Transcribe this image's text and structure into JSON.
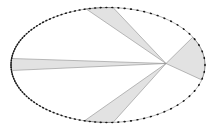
{
  "figure": {
    "name": "elliptical-orbit-equal-area-sectors",
    "canvas": {
      "width": 216,
      "height": 131,
      "background": "#ffffff"
    },
    "ellipse": {
      "cx": 108,
      "cy": 65,
      "rx": 97,
      "ry": 57.5,
      "stroke": "#6e6e6e",
      "stroke_width": 0.5
    },
    "focus": {
      "x": 166,
      "y": 63.5
    },
    "orbit_dots": {
      "count": 104,
      "eccentricity": 0.5,
      "color": "#151515",
      "radius_along": 1.25,
      "radius_across": 0.8
    },
    "wedge_style": {
      "fill": "#e2e2e2",
      "stroke": "#8f8f8f",
      "stroke_width": 0.6
    },
    "wedges": [
      {
        "name": "sector-left",
        "t_start": 173.5,
        "t_end": 185.5
      },
      {
        "name": "sector-top",
        "t_start": 87,
        "t_end": 103
      },
      {
        "name": "sector-right",
        "t_start": -15,
        "t_end": 29
      },
      {
        "name": "sector-bottom",
        "t_start": -104,
        "t_end": -87
      }
    ]
  }
}
